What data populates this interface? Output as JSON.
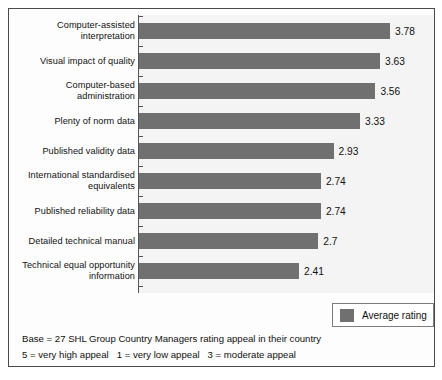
{
  "chart_data": {
    "type": "bar",
    "orientation": "horizontal",
    "title": "",
    "subtitle": "",
    "xlabel": "",
    "ylabel": "",
    "xlim": [
      0,
      4.3
    ],
    "grid": false,
    "legend_position": "bottom-right",
    "bar_color": "#707070",
    "categories": [
      "Computer-assisted\ninterpretation",
      "Visual impact of quality",
      "Computer-based\nadministration",
      "Plenty of norm data",
      "Published validity data",
      "International standardised\nequivalents",
      "Published reliability data",
      "Detailed technical manual",
      "Technical equal opportunity\ninformation"
    ],
    "values": [
      3.78,
      3.63,
      3.56,
      3.33,
      2.93,
      2.74,
      2.74,
      2.7,
      2.41
    ],
    "value_labels": [
      "3.78",
      "3.63",
      "3.56",
      "3.33",
      "2.93",
      "2.74",
      "2.74",
      "2.7",
      "2.41"
    ],
    "series": [
      {
        "name": "Average rating",
        "values": [
          3.78,
          3.63,
          3.56,
          3.33,
          2.93,
          2.74,
          2.74,
          2.7,
          2.41
        ]
      }
    ],
    "legend": [
      "Average rating"
    ],
    "annotations": [
      "Base = 27 SHL Group Country Managers rating appeal in their country",
      "5 = very high appeal   1 = very low appeal   3 = moderate appeal"
    ]
  },
  "rows": [
    {
      "label": "Computer-assisted\ninterpretation",
      "value": 3.78,
      "value_label": "3.78"
    },
    {
      "label": "Visual impact of quality",
      "value": 3.63,
      "value_label": "3.63"
    },
    {
      "label": "Computer-based\nadministration",
      "value": 3.56,
      "value_label": "3.56"
    },
    {
      "label": "Plenty of norm data",
      "value": 3.33,
      "value_label": "3.33"
    },
    {
      "label": "Published validity data",
      "value": 2.93,
      "value_label": "2.93"
    },
    {
      "label": "International standardised\nequivalents",
      "value": 2.74,
      "value_label": "2.74"
    },
    {
      "label": "Published reliability data",
      "value": 2.74,
      "value_label": "2.74"
    },
    {
      "label": "Detailed technical manual",
      "value": 2.7,
      "value_label": "2.7"
    },
    {
      "label": "Technical equal opportunity\ninformation",
      "value": 2.41,
      "value_label": "2.41"
    }
  ],
  "legend": {
    "label": "Average rating",
    "swatch_color": "#707070"
  },
  "footnote": {
    "line1": "Base = 27 SHL Group Country Managers rating appeal in their country",
    "line2": "5 = very high appeal   1 = very low appeal   3 = moderate appeal"
  },
  "scale": {
    "px_per_unit": 66.4,
    "axis_x_px": 130
  }
}
